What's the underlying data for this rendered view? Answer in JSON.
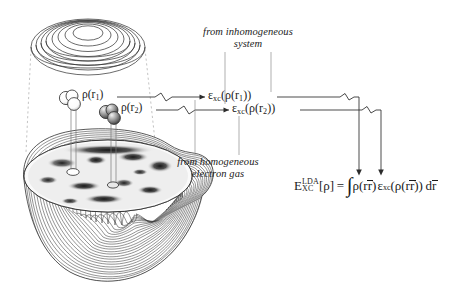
{
  "figure": {
    "type": "scientific-diagram",
    "topic": "Local Density Approximation (LDA) exchange-correlation energy",
    "background_color": "#ffffff",
    "ink_color": "#1a1a1a"
  },
  "notes": {
    "inhomogeneous": {
      "line1": "from inhomogeneous",
      "line2": "system"
    },
    "homogeneous": {
      "line1": "from homogeneous",
      "line2": "electron gas"
    }
  },
  "density_labels": [
    {
      "id": "rho-r1",
      "rho": "ρ(r",
      "sub": "1",
      "close": ")"
    },
    {
      "id": "rho-r2",
      "rho": "ρ(r",
      "sub": "2",
      "close": ")"
    }
  ],
  "epsilon_terms": [
    {
      "id": "eps-r1",
      "eps": "ε",
      "sub_xc": "xc",
      "arg_open": "(ρ(r",
      "arg_sub": "1",
      "arg_close": "))"
    },
    {
      "id": "eps-r2",
      "eps": "ε",
      "sub_xc": "xc",
      "arg_open": "(ρ(r",
      "arg_sub": "2",
      "arg_close": "))"
    }
  ],
  "main_formula": {
    "symbol": "E",
    "superscript": "LDA",
    "subscript": "XC",
    "bracket": "[ρ]",
    "equals": "=",
    "integral": "∫",
    "density": "ρ(r",
    "density_close": ")",
    "epsilon": "ε",
    "epsilon_sub": "xc",
    "epsilon_arg_open": "(ρ(r",
    "epsilon_arg_close": "))",
    "differential": "d",
    "differential_var": "r",
    "plain_text": "E_XC^LDA[ρ] = ∫ ρ(r̄) ε_xc(ρ(r̄)) dr̄"
  },
  "objects": {
    "top_surface": "contour-plot-surface-top",
    "main_surface": "molecular-density-isosurface",
    "cut_plane": "grayscale-density-cut-plane",
    "probe_spheres": "probe-point-spheres"
  }
}
